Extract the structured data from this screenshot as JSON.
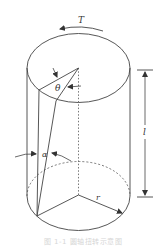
{
  "figure": {
    "type": "cylinder-torsion-diagram",
    "labels": {
      "torque": "T",
      "shear_angle": "α",
      "twist_angle": "θ",
      "length": "l",
      "radius": "r"
    },
    "caption": "图 1-1  圆轴扭转示意图"
  },
  "colors": {
    "stroke": "#444444",
    "background": "#ffffff",
    "caption": "#d6d6d6"
  }
}
